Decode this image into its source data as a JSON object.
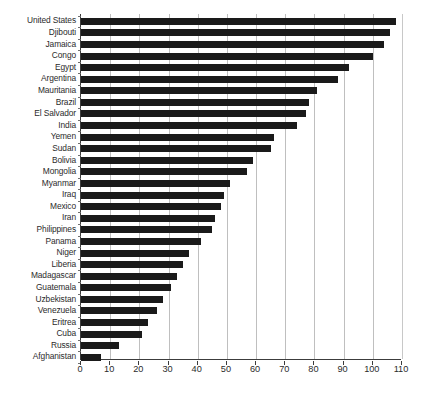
{
  "chart_data": {
    "type": "bar",
    "orientation": "horizontal",
    "title": "",
    "subtitle": "",
    "xlabel": "",
    "ylabel": "",
    "xlim": [
      0,
      110
    ],
    "ylim": null,
    "xticks": [
      0,
      10,
      20,
      30,
      40,
      50,
      60,
      70,
      80,
      90,
      100,
      110
    ],
    "xtick_labels": [
      "0",
      "10",
      "20",
      "30",
      "40",
      "50",
      "60",
      "70",
      "80",
      "90",
      "100",
      "110"
    ],
    "grid": "vertical",
    "legend": null,
    "legend_position": "none",
    "bar_color": "#1a1a1a",
    "gridline_color": "#bfbfbf",
    "axis_color": "#3c3c3c",
    "categories": [
      "United States",
      "Djibouti",
      "Jamaica",
      "Congo",
      "Egypt",
      "Argentina",
      "Mauritania",
      "Brazil",
      "El Salvador",
      "India",
      "Yemen",
      "Sudan",
      "Bolivia",
      "Mongolia",
      "Myanmar",
      "Iraq",
      "Mexico",
      "Iran",
      "Philippines",
      "Panama",
      "Niger",
      "Liberia",
      "Madagascar",
      "Guatemala",
      "Uzbekistan",
      "Venezuela",
      "Eritrea",
      "Cuba",
      "Russia",
      "Afghanistan"
    ],
    "values": [
      108,
      106,
      104,
      100,
      92,
      88,
      81,
      78,
      77,
      74,
      66,
      65,
      59,
      57,
      51,
      49,
      48,
      46,
      45,
      41,
      37,
      35,
      33,
      31,
      28,
      26,
      23,
      21,
      13,
      7
    ]
  }
}
